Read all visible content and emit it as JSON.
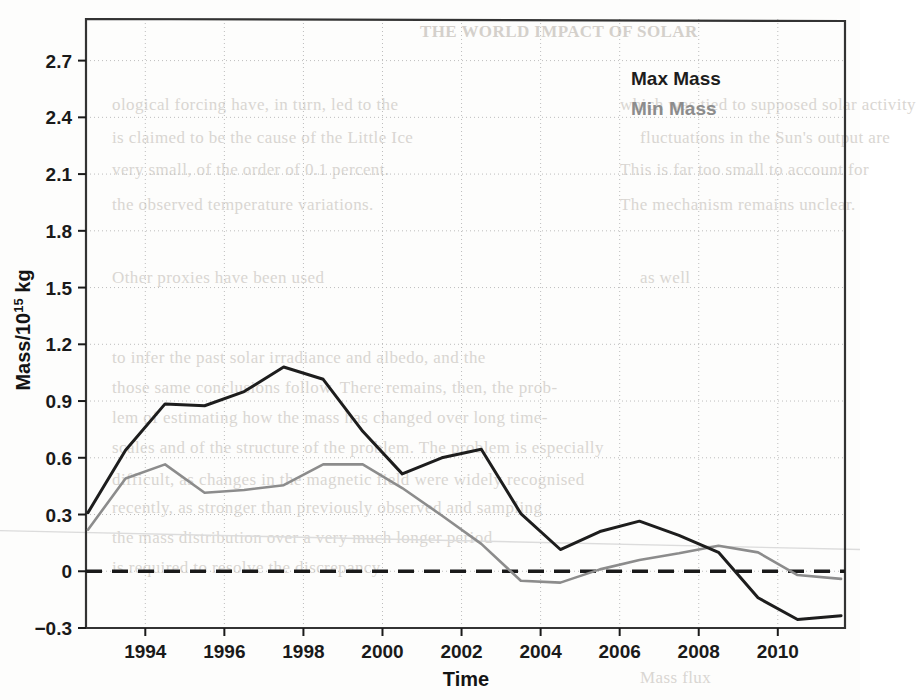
{
  "figure": {
    "background_color": "#fdfdfc",
    "plot_frame_color": "#333333",
    "grid_color": "#bdbdbd",
    "zero_line_label": "zero-reference-dashed-line"
  },
  "background_bleed_text": [
    {
      "text": "THE WORLD IMPACT OF SOLAR",
      "x": 420,
      "y": 22,
      "bold": true
    },
    {
      "text": "ological forcing have, in turn, led to the",
      "x": 112,
      "y": 95,
      "bold": false
    },
    {
      "text": "which was tied to supposed solar activity",
      "x": 620,
      "y": 95,
      "bold": false
    },
    {
      "text": "is claimed to be the cause of the Little Ice",
      "x": 112,
      "y": 128,
      "bold": false
    },
    {
      "text": "fluctuations in the Sun's output are",
      "x": 640,
      "y": 128,
      "bold": false
    },
    {
      "text": "very small, of the order of 0.1 percent.",
      "x": 112,
      "y": 160,
      "bold": false
    },
    {
      "text": "This is far too small to account for",
      "x": 620,
      "y": 160,
      "bold": false
    },
    {
      "text": "the observed temperature variations.",
      "x": 112,
      "y": 195,
      "bold": false
    },
    {
      "text": "The mechanism remains unclear.",
      "x": 620,
      "y": 195,
      "bold": false
    },
    {
      "text": "Other proxies have been used",
      "x": 112,
      "y": 268,
      "bold": false
    },
    {
      "text": "as well",
      "x": 640,
      "y": 268,
      "bold": false
    },
    {
      "text": "to infer the past solar irradiance and albedo, and the",
      "x": 112,
      "y": 348,
      "bold": false
    },
    {
      "text": "those same conclusions follow. There remains, then, the prob-",
      "x": 112,
      "y": 378,
      "bold": false
    },
    {
      "text": "lem of estimating how the mass has changed over long time-",
      "x": 112,
      "y": 408,
      "bold": false
    },
    {
      "text": "scales and of the structure of the problem. The problem is especially",
      "x": 112,
      "y": 438,
      "bold": false
    },
    {
      "text": "difficult, as changes in the magnetic field were widely recognised",
      "x": 112,
      "y": 470,
      "bold": false
    },
    {
      "text": "recently, as stronger than previously observed and sampling",
      "x": 112,
      "y": 498,
      "bold": false
    },
    {
      "text": "the mass distribution over a very much longer period",
      "x": 112,
      "y": 528,
      "bold": false
    },
    {
      "text": "is required to resolve the discrepancy",
      "x": 112,
      "y": 558,
      "bold": false
    },
    {
      "text": "Mass flux",
      "x": 640,
      "y": 668,
      "bold": false
    }
  ],
  "chart_data": {
    "type": "line",
    "title": "",
    "xlabel": "Time",
    "ylabel": "Mass/10^15 kg",
    "ylabel_prefix": "Mass/10",
    "ylabel_superscript": "15",
    "ylabel_suffix": " kg",
    "xlim": [
      1992.5,
      2011.7
    ],
    "ylim": [
      -0.3,
      2.92
    ],
    "grid": true,
    "grid_style": "dotted",
    "legend_position": "top-right",
    "x_ticks": [
      1994,
      1996,
      1998,
      2000,
      2002,
      2004,
      2006,
      2008,
      2010
    ],
    "x_tick_labels": [
      "1994",
      "1996",
      "1998",
      "2000",
      "2002",
      "2004",
      "2006",
      "2008",
      "2010"
    ],
    "y_ticks": [
      -0.3,
      0,
      0.3,
      0.6,
      0.9,
      1.2,
      1.5,
      1.8,
      2.1,
      2.4,
      2.7
    ],
    "y_tick_labels": [
      "-0.3",
      "0",
      "0.3",
      "0.6",
      "0.9",
      "1.2",
      "1.5",
      "1.8",
      "2.1",
      "2.4",
      "2.7"
    ],
    "reference_lines": [
      {
        "name": "zero-line",
        "type": "horizontal-dashed",
        "y": 0,
        "color": "#1a1a1a"
      }
    ],
    "series": [
      {
        "name": "Max Mass",
        "legend_label": "Max Mass",
        "color": "#1d1d1d",
        "width": 3.0,
        "x": [
          1992.55,
          1993.5,
          1994.5,
          1995.5,
          1996.5,
          1997.5,
          1998.5,
          1999.5,
          2000.5,
          2001.5,
          2002.5,
          2003.5,
          2004.5,
          2005.5,
          2006.5,
          2007.5,
          2008.5,
          2009.5,
          2010.5,
          2011.6
        ],
        "y": [
          0.31,
          0.64,
          0.885,
          0.875,
          0.95,
          1.08,
          1.015,
          0.74,
          0.515,
          0.6,
          0.645,
          0.305,
          0.115,
          0.21,
          0.265,
          0.19,
          0.1,
          -0.14,
          -0.255,
          -0.235
        ]
      },
      {
        "name": "Min Mass",
        "legend_label": "Min Mass",
        "color": "#8c8c8c",
        "width": 2.6,
        "x": [
          1992.55,
          1993.5,
          1994.5,
          1995.5,
          1996.5,
          1997.5,
          1998.5,
          1999.5,
          2000.5,
          2001.5,
          2002.5,
          2003.5,
          2004.5,
          2005.5,
          2006.5,
          2007.5,
          2008.5,
          2009.5,
          2010.5,
          2011.6
        ],
        "y": [
          0.22,
          0.49,
          0.565,
          0.415,
          0.43,
          0.455,
          0.565,
          0.565,
          0.44,
          0.295,
          0.145,
          -0.05,
          -0.06,
          0.01,
          0.06,
          0.095,
          0.135,
          0.1,
          -0.02,
          -0.04
        ]
      }
    ],
    "artifact_line": {
      "name": "scan-ruled-line",
      "color": "#dcdcdc",
      "y_left": 0.215,
      "y_right": 0.115
    }
  },
  "legend": {
    "items": [
      {
        "label": "Max Mass",
        "color": "#1d1d1d"
      },
      {
        "label": "Min Mass",
        "color": "#8c8c8c"
      }
    ]
  }
}
